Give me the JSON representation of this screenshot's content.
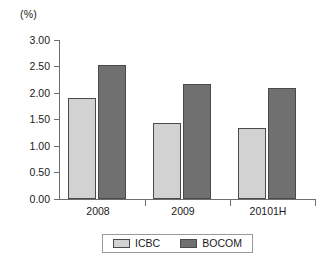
{
  "chart_data": {
    "type": "bar",
    "title": "",
    "subtitle": "",
    "unit_label": "(%)",
    "xlabel": "",
    "ylabel": "",
    "categories": [
      "2008",
      "2009",
      "20101H"
    ],
    "series": [
      {
        "name": "ICBC",
        "values": [
          1.9,
          1.43,
          1.35
        ],
        "color": "#d2d2d2"
      },
      {
        "name": "BOCOM",
        "values": [
          2.52,
          2.17,
          2.1
        ],
        "color": "#707070"
      }
    ],
    "ylim": [
      0.0,
      3.0
    ],
    "ytick_step": 0.5,
    "ytick_labels": [
      "0.00",
      "0.50",
      "1.00",
      "1.50",
      "2.00",
      "2.50",
      "3.00"
    ],
    "ytick_values": [
      0.0,
      0.5,
      1.0,
      1.5,
      2.0,
      2.5,
      3.0
    ],
    "grid": false,
    "legend_position": "bottom"
  },
  "legend": {
    "entries": [
      {
        "label": "ICBC"
      },
      {
        "label": "BOCOM"
      }
    ]
  }
}
